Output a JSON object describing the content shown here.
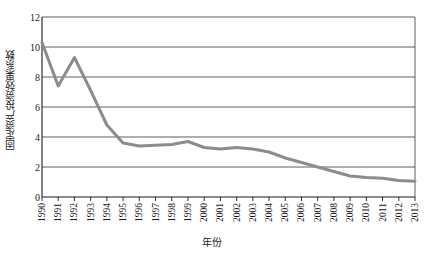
{
  "chart_data": {
    "type": "line",
    "title": "",
    "xlabel": "年份",
    "ylabel": "固定资产投资效果系数",
    "grid": true,
    "legend": false,
    "xlim": [
      1990,
      2013
    ],
    "ylim": [
      0,
      12
    ],
    "ytick_labels": [
      "0",
      "2",
      "4",
      "6",
      "8",
      "10",
      "12"
    ],
    "ytick_values": [
      0,
      2,
      4,
      6,
      8,
      10,
      12
    ],
    "categories": [
      "1990",
      "1991",
      "1992",
      "1993",
      "1994",
      "1995",
      "1996",
      "1997",
      "1998",
      "1999",
      "2000",
      "2001",
      "2002",
      "2003",
      "2004",
      "2005",
      "2006",
      "2007",
      "2008",
      "2009",
      "2010",
      "2011",
      "2012",
      "2013"
    ],
    "series": [
      {
        "name": "固定资产投资效果系数",
        "color": "#8c8c8c",
        "line_width": 3,
        "values": [
          10.3,
          7.4,
          9.3,
          7.1,
          4.8,
          3.6,
          3.4,
          3.45,
          3.5,
          3.7,
          3.3,
          3.2,
          3.3,
          3.2,
          3.0,
          2.6,
          2.3,
          2.0,
          1.7,
          1.4,
          1.3,
          1.25,
          1.1,
          1.05
        ]
      }
    ]
  },
  "axes": {
    "y_title": "固定资产投资效果系数",
    "x_title": "年份"
  },
  "style": {
    "line_color": "#8c8c8c",
    "grid_color": "#4d4d4d",
    "axis_color": "#1a1a1a",
    "text_color": "#1a1a1a",
    "background": "#ffffff"
  }
}
